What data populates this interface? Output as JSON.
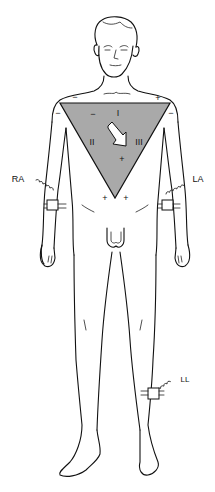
{
  "figure": {
    "triangle_fill": "#a9a9a9",
    "line_color": "#111111",
    "triangle": {
      "lead_labels": {
        "lead1": "I",
        "lead2": "II",
        "lead3": "III"
      },
      "polarity": {
        "top_left_outer": "−",
        "top_right_outer": "+",
        "left_outer": "−",
        "right_outer": "−",
        "inner_minus": "−",
        "inner_plus": "+",
        "apex_left": "+",
        "apex_right": "+"
      },
      "axis_arrow": "mean-electrical-axis-arrow"
    },
    "electrodes": {
      "right_arm": "RA",
      "left_arm": "LA",
      "left_leg": "LL"
    }
  }
}
